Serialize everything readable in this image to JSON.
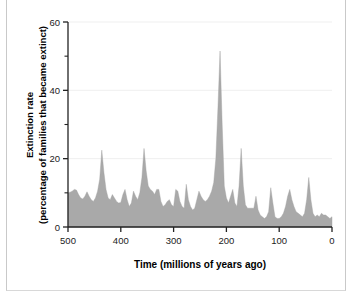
{
  "chart_data": {
    "type": "area",
    "title": "",
    "xlabel": "Time  (millions of years ago)",
    "ylabel_line1": "Extinction rate",
    "ylabel_line2": "(percentage of families that became extinct)",
    "xlim": [
      500,
      0
    ],
    "ylim": [
      0,
      60
    ],
    "x_reversed": true,
    "grid": false,
    "legend": "none",
    "fill_color": "#a9a9a9",
    "axis_color": "#222222",
    "background": "#ffffff",
    "x_ticks": [
      500,
      400,
      300,
      200,
      100,
      0
    ],
    "x_tick_labels": [
      "500",
      "400",
      "300",
      "200",
      "100",
      "0"
    ],
    "y_ticks_major": [
      0,
      20,
      40,
      60
    ],
    "y_tick_labels": [
      "0",
      "20",
      "40",
      "60"
    ],
    "y_ticks_minor": [
      10,
      30,
      50
    ],
    "series_name": "Extinction rate",
    "units": "percent of families",
    "x": [
      500,
      496,
      492,
      488,
      484,
      480,
      476,
      472,
      468,
      464,
      460,
      456,
      452,
      448,
      444,
      440,
      436,
      432,
      428,
      424,
      420,
      416,
      412,
      408,
      404,
      400,
      396,
      392,
      388,
      384,
      380,
      376,
      372,
      368,
      364,
      360,
      356,
      352,
      348,
      344,
      340,
      336,
      332,
      328,
      324,
      320,
      316,
      312,
      308,
      304,
      300,
      296,
      292,
      288,
      284,
      280,
      276,
      272,
      268,
      264,
      260,
      256,
      252,
      248,
      244,
      240,
      236,
      232,
      228,
      224,
      220,
      216,
      212,
      208,
      204,
      200,
      196,
      192,
      188,
      184,
      180,
      176,
      172,
      168,
      164,
      160,
      156,
      152,
      148,
      144,
      140,
      136,
      132,
      128,
      124,
      120,
      116,
      112,
      108,
      104,
      100,
      96,
      92,
      88,
      84,
      80,
      76,
      72,
      68,
      64,
      60,
      56,
      52,
      48,
      44,
      40,
      36,
      32,
      28,
      24,
      20,
      16,
      12,
      8,
      4,
      0
    ],
    "y": [
      10.0,
      10.2,
      10.5,
      11.0,
      10.8,
      9.5,
      8.5,
      8.2,
      9.0,
      10.3,
      9.0,
      8.0,
      7.5,
      8.5,
      10.5,
      14.0,
      22.5,
      16.0,
      11.0,
      8.5,
      8.0,
      9.5,
      8.5,
      7.5,
      7.0,
      7.2,
      9.5,
      11.0,
      8.0,
      6.0,
      7.0,
      10.5,
      9.0,
      8.0,
      10.0,
      14.5,
      23.0,
      16.5,
      12.0,
      11.0,
      10.5,
      9.5,
      11.0,
      11.0,
      7.5,
      6.0,
      6.5,
      7.5,
      8.0,
      6.5,
      6.0,
      11.0,
      10.5,
      7.5,
      6.0,
      5.5,
      12.5,
      8.0,
      6.0,
      5.0,
      5.5,
      8.0,
      10.5,
      9.0,
      8.0,
      7.5,
      8.0,
      9.0,
      10.5,
      13.0,
      20.0,
      35.0,
      51.5,
      30.0,
      12.0,
      8.5,
      7.0,
      9.0,
      11.0,
      7.0,
      6.0,
      12.0,
      23.0,
      12.0,
      6.5,
      5.5,
      5.5,
      5.5,
      5.5,
      9.0,
      5.0,
      3.5,
      3.0,
      2.5,
      3.0,
      4.5,
      11.5,
      7.0,
      3.0,
      2.5,
      2.5,
      3.0,
      4.0,
      6.0,
      9.0,
      11.0,
      8.0,
      6.0,
      4.5,
      4.0,
      3.5,
      3.0,
      4.0,
      8.0,
      14.5,
      8.0,
      4.0,
      3.0,
      3.5,
      3.0,
      4.0,
      3.5,
      3.5,
      3.0,
      2.5,
      3.0,
      2.0,
      1.0
    ],
    "annotations": [
      {
        "label": "late Ordovician peak",
        "x": 436,
        "y": 22.5
      },
      {
        "label": "late Devonian peak",
        "x": 356,
        "y": 23.0
      },
      {
        "label": "end-Permian peak",
        "x": 252,
        "y": 51.5
      },
      {
        "label": "end-Triassic peak",
        "x": 208,
        "y": 23.0
      },
      {
        "label": "end-Cretaceous peak",
        "x": 68,
        "y": 14.5
      }
    ]
  }
}
